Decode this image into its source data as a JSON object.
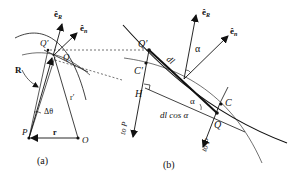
{
  "figure": {
    "panel_a": {
      "caption": "(a)",
      "points": {
        "P": "P",
        "O": "O",
        "Q": "Q",
        "Q_prime": "Q′"
      },
      "vectors": {
        "R": "R",
        "r": "r",
        "r_prime": "r′",
        "e_R": "ê",
        "e_R_sub": "R",
        "e_n": "ê",
        "e_n_sub": "n"
      },
      "angle": "Δθ"
    },
    "panel_b": {
      "caption": "(b)",
      "points": {
        "Q_prime": "Q′",
        "C_prime": "C′",
        "H": "H",
        "C": "C",
        "Q": "Q"
      },
      "vectors": {
        "e_R": "ê",
        "e_R_sub": "R",
        "e_n": "ê",
        "e_n_sub": "n"
      },
      "segment": "dl",
      "angle_top": "α",
      "angle_bottom": "α",
      "projection": "dl cos α",
      "direction_left": "to P",
      "direction_right": "to P"
    },
    "colors": {
      "ink": "#111111",
      "background": "#ffffff"
    }
  }
}
